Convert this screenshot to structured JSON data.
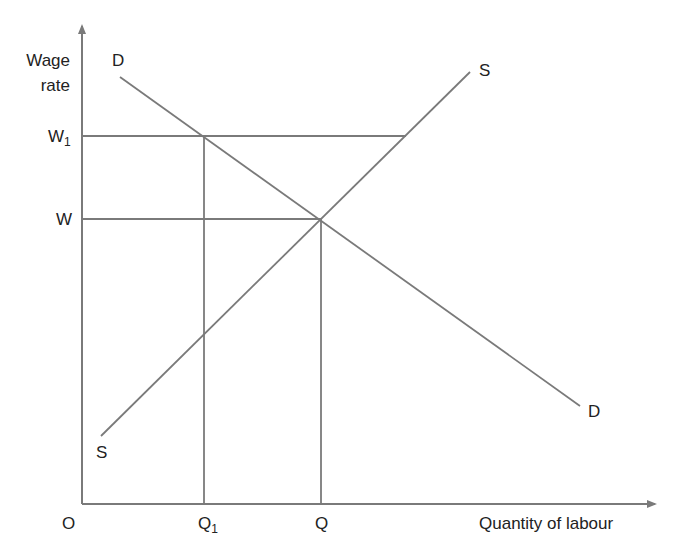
{
  "diagram": {
    "type": "labour market supply and demand",
    "y_axis_label_line1": "Wage",
    "y_axis_label_line2": "rate",
    "x_axis_label": "Quantity of labour",
    "origin_label": "O",
    "wage_levels": {
      "w1": {
        "base": "W",
        "sub": "1"
      },
      "w": {
        "base": "W",
        "sub": ""
      }
    },
    "quantity_levels": {
      "q1": {
        "base": "Q",
        "sub": "1"
      },
      "q": {
        "base": "Q",
        "sub": ""
      }
    },
    "curves": {
      "demand_start_label": "D",
      "demand_end_label": "D",
      "supply_start_label": "S",
      "supply_end_label": "S"
    },
    "colors": {
      "line": "#7a7a7a",
      "text": "#222222"
    }
  }
}
